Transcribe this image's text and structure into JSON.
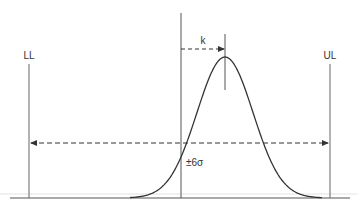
{
  "diagram": {
    "type": "process-capability-normal-curve",
    "labels": {
      "lower_limit": "LL",
      "upper_limit": "UL",
      "shift": "k",
      "spread": "±6σ"
    },
    "colors": {
      "line": "#555555",
      "curve": "#333333",
      "baseline_light": "#d8d8d8"
    }
  }
}
